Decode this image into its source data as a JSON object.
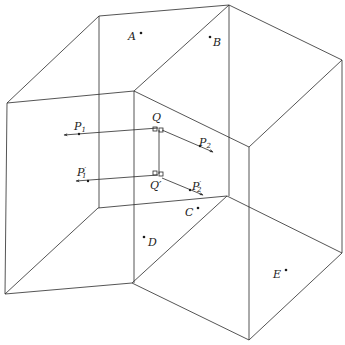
{
  "figure": {
    "colors": {
      "line": "#2a2a2a",
      "text": "#222222",
      "background": "#ffffff"
    },
    "edges": [
      [
        7,
        103,
        99,
        16
      ],
      [
        99,
        16,
        229,
        5
      ],
      [
        229,
        5,
        342,
        60
      ],
      [
        7,
        103,
        134,
        91
      ],
      [
        134,
        91,
        229,
        5
      ],
      [
        134,
        91,
        249,
        147
      ],
      [
        249,
        147,
        342,
        60
      ],
      [
        99,
        16,
        99,
        208
      ],
      [
        229,
        5,
        229,
        196
      ],
      [
        342,
        60,
        342,
        253
      ],
      [
        249,
        147,
        249,
        340
      ],
      [
        134,
        91,
        134,
        283
      ],
      [
        7,
        103,
        5,
        294
      ],
      [
        5,
        294,
        132,
        283
      ],
      [
        5,
        294,
        98,
        208
      ],
      [
        98,
        208,
        227,
        196
      ],
      [
        132,
        283,
        227,
        196
      ],
      [
        132,
        283,
        249,
        340
      ],
      [
        249,
        340,
        342,
        253
      ],
      [
        227,
        196,
        342,
        253
      ]
    ],
    "points": [
      {
        "id": "A",
        "label": "A",
        "x": 141,
        "y": 33,
        "lx": 128,
        "ly": 40
      },
      {
        "id": "B",
        "label": "B",
        "x": 210,
        "y": 37,
        "lx": 213,
        "ly": 46
      },
      {
        "id": "C",
        "label": "C",
        "x": 198,
        "y": 208,
        "lx": 185,
        "ly": 216
      },
      {
        "id": "D",
        "label": "D",
        "x": 144,
        "y": 237,
        "lx": 148,
        "ly": 246
      },
      {
        "id": "E",
        "label": "E",
        "x": 286,
        "y": 270,
        "lx": 273,
        "ly": 278
      }
    ],
    "vectors": [
      {
        "id": "QP1",
        "from": [
          158,
          128
        ],
        "to": [
          64,
          135
        ],
        "dot": [
          79,
          134
        ],
        "label": "P",
        "sub": "1",
        "prime": false,
        "lx": 74,
        "ly": 130
      },
      {
        "id": "QP2",
        "from": [
          162,
          130
        ],
        "to": [
          213,
          152
        ],
        "dot": [
          200,
          146
        ],
        "label": "P",
        "sub": "2",
        "prime": false,
        "lx": 199,
        "ly": 146
      },
      {
        "id": "Q'P1'",
        "from": [
          158,
          175
        ],
        "to": [
          76,
          181
        ],
        "dot": [
          88,
          181
        ],
        "label": "P",
        "sub": "1",
        "prime": true,
        "lx": 77,
        "ly": 176
      },
      {
        "id": "Q'P2'",
        "from": [
          162,
          178
        ],
        "to": [
          203,
          195
        ],
        "dot": [
          190,
          190
        ],
        "label": "P",
        "sub": "2",
        "prime": true,
        "lx": 192,
        "ly": 190
      }
    ],
    "Q": {
      "label": "Q",
      "x": 158,
      "y": 128,
      "lx": 152,
      "ly": 121
    },
    "Qprime": {
      "label": "Q'",
      "x": 158,
      "y": 175,
      "lx": 151,
      "ly": 189
    },
    "QQ_segment": [
      159,
      130,
      159,
      174
    ]
  },
  "labels": {
    "A": "A",
    "B": "B",
    "C": "C",
    "D": "D",
    "E": "E",
    "Q": "Q",
    "Qp": "Q′",
    "P1": "P",
    "P1_sub": "1",
    "P2": "P",
    "P2_sub": "2",
    "P1p": "P",
    "P1p_sub": "1",
    "P2p": "P",
    "P2p_sub": "2",
    "prime": "′"
  }
}
